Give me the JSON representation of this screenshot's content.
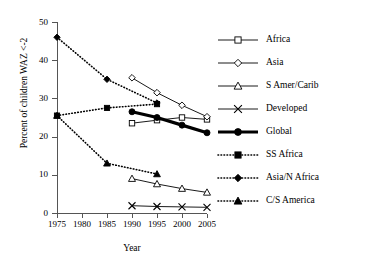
{
  "chart_data": {
    "type": "line",
    "title": "",
    "xlabel": "Year",
    "ylabel": "Percent of children WAZ <-2",
    "xlim": [
      1975,
      2005
    ],
    "ylim": [
      0,
      50
    ],
    "xticks": [
      1975,
      1980,
      1985,
      1990,
      1995,
      2000,
      2005
    ],
    "yticks": [
      0,
      10,
      20,
      30,
      40,
      50
    ],
    "grid": false,
    "legend_position": "right",
    "series": [
      {
        "name": "Africa",
        "marker": "open-square",
        "line": "solid",
        "x": [
          1990,
          1995,
          2000,
          2005
        ],
        "values": [
          23.5,
          24.3,
          25.0,
          24.5
        ]
      },
      {
        "name": "Asia",
        "marker": "open-diamond",
        "line": "solid",
        "x": [
          1990,
          1995,
          2000,
          2005
        ],
        "values": [
          35.4,
          31.5,
          28.2,
          25.2
        ]
      },
      {
        "name": "S Amer/Carib",
        "marker": "open-triangle",
        "line": "solid",
        "x": [
          1990,
          1995,
          2000,
          2005
        ],
        "values": [
          9.0,
          7.6,
          6.4,
          5.4
        ]
      },
      {
        "name": "Developed",
        "marker": "cross-x",
        "line": "solid",
        "x": [
          1990,
          1995,
          2000,
          2005
        ],
        "values": [
          1.9,
          1.7,
          1.6,
          1.5
        ]
      },
      {
        "name": "Global",
        "marker": "filled-circle",
        "line": "thick",
        "x": [
          1990,
          1995,
          2000,
          2005
        ],
        "values": [
          26.5,
          25.0,
          23.0,
          21.0
        ]
      },
      {
        "name": "SS Africa",
        "marker": "filled-square",
        "line": "dotted",
        "x": [
          1975,
          1985,
          1995
        ],
        "values": [
          25.5,
          27.5,
          28.5
        ]
      },
      {
        "name": "Asia/N Africa",
        "marker": "filled-diamond",
        "line": "dotted",
        "x": [
          1975,
          1985,
          1995
        ],
        "values": [
          46.0,
          35.0,
          28.8
        ]
      },
      {
        "name": "C/S America",
        "marker": "filled-triangle",
        "line": "dotted",
        "x": [
          1975,
          1985,
          1995
        ],
        "values": [
          25.5,
          13.0,
          10.2
        ]
      }
    ]
  },
  "legend": {
    "items": [
      {
        "label": "Africa"
      },
      {
        "label": "Asia"
      },
      {
        "label": "S Amer/Carib"
      },
      {
        "label": "Developed"
      },
      {
        "label": "Global"
      },
      {
        "label": "SS Africa"
      },
      {
        "label": "Asia/N Africa"
      },
      {
        "label": "C/S America"
      }
    ]
  },
  "colors": {
    "line": "#000000",
    "axis": "#555555",
    "background": "#ffffff"
  }
}
